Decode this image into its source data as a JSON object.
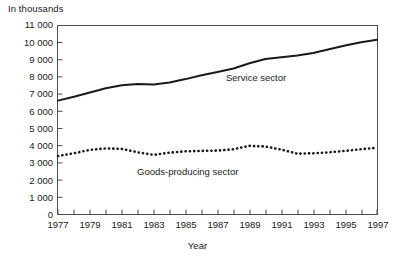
{
  "unit_label": "In thousands",
  "xaxis_label": "Year",
  "series_labels": {
    "service": "Service sector",
    "goods": "Goods-producing sector"
  },
  "colors": {
    "line": "#1a1a1a",
    "axis": "#4d4d4d",
    "background": "#ffffff",
    "text": "#1a1a1a"
  },
  "y_ticks": [
    "0",
    "1 000",
    "2 000",
    "3 000",
    "4 000",
    "5 000",
    "6 000",
    "7 000",
    "8 000",
    "9 000",
    "10 000",
    "11 000"
  ],
  "x_ticks": [
    "1977",
    "1979",
    "1981",
    "1983",
    "1985",
    "1987",
    "1989",
    "1991",
    "1993",
    "1995",
    "1997"
  ],
  "chart_data": {
    "type": "line",
    "title": "",
    "subtitle": "",
    "unit_note": "In thousands",
    "xlabel": "Year",
    "ylabel": "",
    "xlim": [
      1977,
      1997
    ],
    "ylim": [
      0,
      11000
    ],
    "ytick_step": 1000,
    "xtick_step_labeled": 2,
    "xtick_step_minor": 1,
    "grid": false,
    "legend": "inline-annotations",
    "x": [
      1977,
      1978,
      1979,
      1980,
      1981,
      1982,
      1983,
      1984,
      1985,
      1986,
      1987,
      1988,
      1989,
      1990,
      1991,
      1992,
      1993,
      1994,
      1995,
      1996,
      1997
    ],
    "series": [
      {
        "name": "Service sector",
        "style": "solid",
        "values": [
          6630,
          6850,
          7100,
          7350,
          7520,
          7600,
          7560,
          7680,
          7880,
          8100,
          8300,
          8500,
          8800,
          9050,
          9150,
          9250,
          9400,
          9620,
          9830,
          10020,
          10170
        ]
      },
      {
        "name": "Goods-producing sector",
        "style": "dotted",
        "values": [
          3400,
          3560,
          3760,
          3850,
          3820,
          3620,
          3470,
          3600,
          3680,
          3700,
          3720,
          3800,
          3990,
          3960,
          3780,
          3540,
          3560,
          3620,
          3700,
          3800,
          3880
        ]
      }
    ]
  }
}
